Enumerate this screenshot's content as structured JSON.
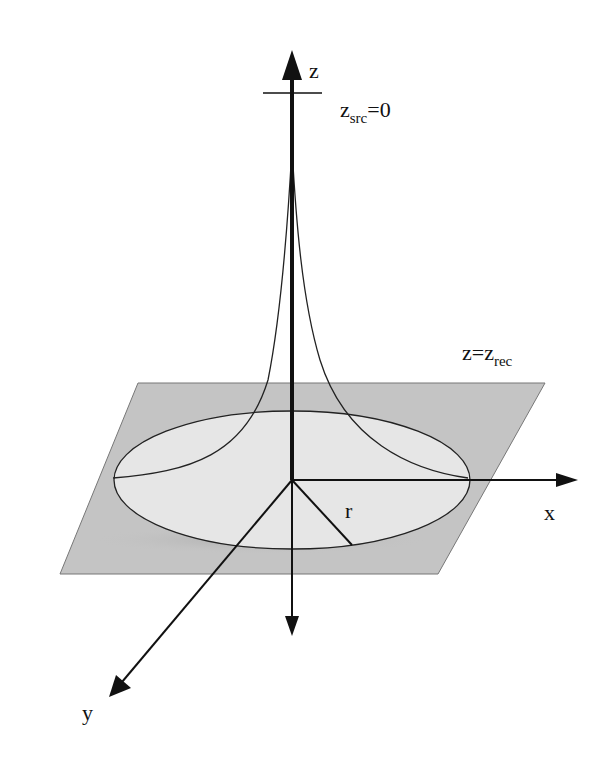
{
  "diagram": {
    "colors": {
      "background": "#ffffff",
      "plane_fill": "#c4c4c4",
      "ellipse_fill": "#e6e6e6",
      "lines": "#111111"
    },
    "labels": {
      "z_axis": "z",
      "x_axis": "x",
      "y_axis": "y",
      "radius": "r",
      "source_var": "z",
      "source_sub": "src",
      "source_eq": "=0",
      "receiver_var": "z=z",
      "receiver_sub": "rec"
    }
  }
}
